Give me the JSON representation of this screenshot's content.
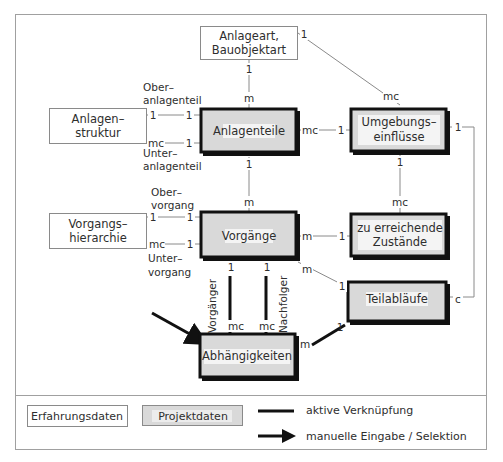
{
  "diagram": {
    "entities": {
      "anlageart": {
        "line1": "Anlageart,",
        "line2": "Bauobjektart",
        "kind": "Erfahrungsdaten"
      },
      "anlagenstruktur": {
        "line1": "Anlagen–",
        "line2": "struktur",
        "kind": "Erfahrungsdaten"
      },
      "anlagenteile": {
        "label": "Anlagenteile",
        "kind": "Projektdaten"
      },
      "umgebungseinfluesse": {
        "line1": "Umgebungs–",
        "line2": "einflüsse",
        "kind": "Projektdaten"
      },
      "vorgangshierarchie": {
        "line1": "Vorgangs–",
        "line2": "hierarchie",
        "kind": "Erfahrungsdaten"
      },
      "vorgaenge": {
        "label": "Vorgänge",
        "kind": "Projektdaten"
      },
      "zustaende": {
        "line1": "zu erreichende",
        "line2": "Zustände",
        "kind": "Projektdaten"
      },
      "teilablaeufe": {
        "label": "Teilabläufe",
        "kind": "Projektdaten"
      },
      "abhaengigkeiten": {
        "label": "Abhängigkeiten",
        "kind": "Projektdaten"
      }
    },
    "roles": {
      "oberanlagenteil": {
        "line1": "Ober–",
        "line2": "anlagenteil"
      },
      "unteranlagenteil": {
        "line1": "Unter–",
        "line2": "anlagenteil"
      },
      "obervorgang": {
        "line1": "Ober–",
        "line2": "vorgang"
      },
      "untervorgang": {
        "line1": "Unter–",
        "line2": "vorgang"
      },
      "vorgaenger": "Vorgänger",
      "nachfolger": "Nachfolger"
    },
    "cardinalities": {
      "anlageart_to_anlagenteile": [
        "1",
        "m"
      ],
      "anlageart_to_umgebung": [
        "1",
        "mc"
      ],
      "struktur_ober": [
        "1",
        "1"
      ],
      "struktur_unter": [
        "mc",
        "1"
      ],
      "anlagenteile_to_umgebung": [
        "mc",
        "1"
      ],
      "anlagenteile_to_vorgaenge": [
        "1",
        "m"
      ],
      "umgebung_to_zustaende": [
        "1",
        "mc"
      ],
      "umgebung_to_teilablaeufe": [
        "1",
        "c"
      ],
      "hierarchie_ober": [
        "1",
        "1"
      ],
      "hierarchie_unter": [
        "mc",
        "1"
      ],
      "vorgaenge_to_zustaende": [
        "m",
        "1"
      ],
      "vorgaenge_to_teilablaeufe": [
        "m",
        "1"
      ],
      "vorgaenger_link": [
        "1",
        "mc"
      ],
      "nachfolger_link": [
        "1",
        "mc"
      ],
      "teilablaeufe_to_abhaengigkeiten": [
        "1",
        "m"
      ]
    }
  },
  "legend": {
    "erfahrungsdaten": "Erfahrungsdaten",
    "projektdaten": "Projektdaten",
    "aktive_verknuepfung": "aktive Verknüpfung",
    "manuelle_eingabe": "manuelle Eingabe / Selektion"
  },
  "colors": {
    "projekt_fill": "#d9d9d9",
    "erfahrung_fill": "#ffffff",
    "border_dark": "#111111",
    "line": "#8a8a8a",
    "frame": "#a0a0a0"
  }
}
